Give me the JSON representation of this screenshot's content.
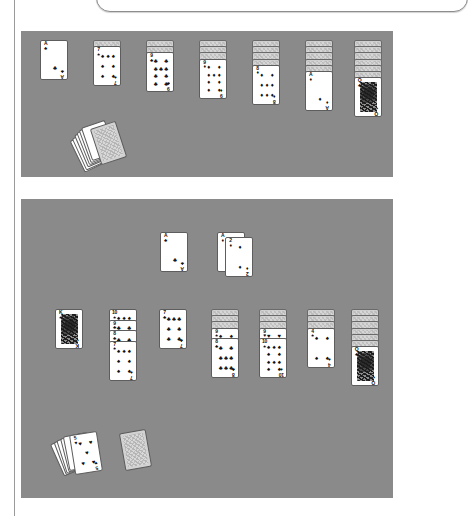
{
  "page": {
    "background_color": "#ffffff",
    "felt_color": "#8a8a8a",
    "rule_color": "#9a9a9a",
    "card_face_color": "#ffffff",
    "card_back_color": "#d2d2d2"
  },
  "suit_glyphs": {
    "spades": "♠",
    "hearts": "♥",
    "diamonds": "♦",
    "clubs": "♣"
  },
  "top_board": {
    "label": "Solitaire board - first state",
    "columns": [
      {
        "name": "tableau-column-1",
        "face_down": 0,
        "face_up": [
          {
            "rank": "A",
            "suit": "clubs",
            "suit_glyph": "♣",
            "color": "black"
          }
        ]
      },
      {
        "name": "tableau-column-2",
        "face_down": 1,
        "face_up": [
          {
            "rank": "7",
            "suit": "spades",
            "suit_glyph": "♠",
            "color": "black"
          }
        ]
      },
      {
        "name": "tableau-column-3",
        "face_down": 2,
        "face_up": [
          {
            "rank": "9",
            "suit": "clubs",
            "suit_glyph": "♣",
            "color": "black"
          }
        ]
      },
      {
        "name": "tableau-column-4",
        "face_down": 3,
        "face_up": [
          {
            "rank": "9",
            "suit": "diamonds",
            "suit_glyph": "♦",
            "color": "red"
          }
        ]
      },
      {
        "name": "tableau-column-5",
        "face_down": 4,
        "face_up": [
          {
            "rank": "8",
            "suit": "diamonds",
            "suit_glyph": "♦",
            "color": "red"
          }
        ]
      },
      {
        "name": "tableau-column-6",
        "face_down": 5,
        "face_up": [
          {
            "rank": "A",
            "suit": "diamonds",
            "suit_glyph": "♦",
            "color": "red"
          }
        ]
      },
      {
        "name": "tableau-column-7",
        "face_down": 6,
        "face_up": [
          {
            "rank": "Q",
            "suit": "clubs",
            "suit_glyph": "♣",
            "color": "black",
            "court": true
          }
        ]
      }
    ],
    "waste_fan_count": 6,
    "stock_label": "stock-pile"
  },
  "bottom_board": {
    "label": "Solitaire board - second state",
    "foundations": [
      {
        "name": "foundation-clubs",
        "rank": "A",
        "suit": "clubs",
        "suit_glyph": "♣",
        "color": "black"
      },
      {
        "name": "foundation-diamonds-under",
        "rank": "A",
        "suit": "diamonds",
        "suit_glyph": "♦",
        "color": "red"
      },
      {
        "name": "foundation-diamonds",
        "rank": "2",
        "suit": "diamonds",
        "suit_glyph": "♦",
        "color": "red"
      }
    ],
    "columns": [
      {
        "name": "tableau-column-1",
        "face_down": 0,
        "face_up": [
          {
            "rank": "K",
            "suit": "spades",
            "suit_glyph": "♠",
            "color": "black",
            "court": true
          }
        ]
      },
      {
        "name": "tableau-column-2",
        "face_down": 0,
        "face_up": [
          {
            "rank": "10",
            "suit": "spades",
            "suit_glyph": "♠",
            "color": "black"
          },
          {
            "rank": "9",
            "suit": "clubs",
            "suit_glyph": "♣",
            "color": "black"
          },
          {
            "rank": "8",
            "suit": "clubs",
            "suit_glyph": "♣",
            "color": "black"
          },
          {
            "rank": "7",
            "suit": "spades",
            "suit_glyph": "♠",
            "color": "black"
          }
        ]
      },
      {
        "name": "tableau-column-3",
        "face_down": 0,
        "face_up": [
          {
            "rank": "7",
            "suit": "clubs",
            "suit_glyph": "♣",
            "color": "black"
          }
        ]
      },
      {
        "name": "tableau-column-4",
        "face_down": 3,
        "face_up": [
          {
            "rank": "9",
            "suit": "spades",
            "suit_glyph": "♠",
            "color": "black"
          },
          {
            "rank": "8",
            "suit": "clubs",
            "suit_glyph": "♣",
            "color": "black"
          }
        ]
      },
      {
        "name": "tableau-column-5",
        "face_down": 3,
        "face_up": [
          {
            "rank": "9",
            "suit": "hearts",
            "suit_glyph": "♥",
            "color": "red"
          },
          {
            "rank": "10",
            "suit": "spades",
            "suit_glyph": "♠",
            "color": "black"
          }
        ]
      },
      {
        "name": "tableau-column-6",
        "face_down": 3,
        "face_up": [
          {
            "rank": "4",
            "suit": "spades",
            "suit_glyph": "♠",
            "color": "black"
          }
        ]
      },
      {
        "name": "tableau-column-7",
        "face_down": 6,
        "face_up": [
          {
            "rank": "Q",
            "suit": "clubs",
            "suit_glyph": "♣",
            "color": "black",
            "court": true
          }
        ]
      }
    ],
    "waste": {
      "name": "waste-pile",
      "fan_count": 5,
      "top_card": {
        "rank": "5",
        "suit": "hearts",
        "suit_glyph": "♥",
        "color": "red"
      }
    },
    "stock_label": "stock-pile"
  }
}
